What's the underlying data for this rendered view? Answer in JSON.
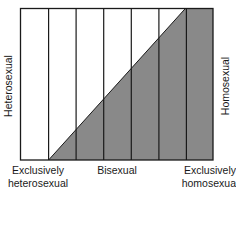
{
  "diagram": {
    "columns": 7,
    "box": {
      "x": 20,
      "y": 8,
      "width": 193,
      "height": 152
    },
    "colors": {
      "fill": "#898989",
      "stroke": "#1a1a1a",
      "background": "#ffffff"
    },
    "left_label": "Heterosexual",
    "right_label": "Homosexual",
    "bottom_labels": [
      {
        "line1": "Exclusively",
        "line2": "heterosexual",
        "x": 38
      },
      {
        "line1": "Bisexual",
        "line2": "",
        "x": 117
      },
      {
        "line1": "Exclusively",
        "line2": "homosexual",
        "x": 211
      }
    ]
  }
}
